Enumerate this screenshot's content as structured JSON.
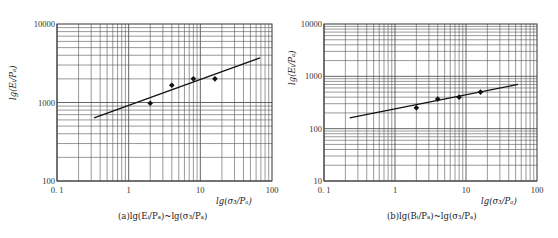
{
  "chart_data": [
    {
      "id": "a",
      "type": "scatter",
      "scale": "log-log",
      "caption": "(a)lg(Eᵢ/Pₐ)~lg(σ₃/Pₐ)",
      "xlabel": "lg(σ₃/Pₐ)",
      "ylabel": "lg(Eᵢ/Pₐ)",
      "xlim": [
        0.1,
        100
      ],
      "ylim": [
        100,
        10000
      ],
      "x_ticks": [
        "0.1",
        "1",
        "10",
        "100"
      ],
      "y_ticks": [
        "100",
        "1000",
        "10000"
      ],
      "grid": true,
      "series": [
        {
          "name": "test points",
          "marker": "diamond",
          "x": [
            2.0,
            4.0,
            8.0,
            16.0
          ],
          "y": [
            980,
            1660,
            2000,
            2000
          ]
        },
        {
          "name": "fitted line",
          "style": "line",
          "x": [
            0.33,
            68
          ],
          "y": [
            635,
            3700
          ]
        }
      ]
    },
    {
      "id": "b",
      "type": "scatter",
      "scale": "log-log",
      "caption": "(b)lg(Bᵢ/Pₐ)~lg(σ₃/Pₐ)",
      "xlabel": "lg(σ₃/Pₐ)",
      "ylabel": "lg(Eᵢ/Pₐ)",
      "xlim": [
        0.1,
        100
      ],
      "ylim": [
        10,
        10000
      ],
      "x_ticks": [
        "0.1",
        "1",
        "10",
        "100"
      ],
      "y_ticks": [
        "10",
        "100",
        "1000",
        "10000"
      ],
      "grid": true,
      "series": [
        {
          "name": "test points",
          "marker": "diamond",
          "x": [
            2.0,
            4.0,
            8.0,
            16.0
          ],
          "y": [
            250,
            370,
            400,
            500
          ]
        },
        {
          "name": "fitted line",
          "style": "line",
          "x": [
            0.23,
            54
          ],
          "y": [
            160,
            700
          ]
        }
      ]
    }
  ],
  "layout": {
    "a": {
      "left": 57,
      "right": 272,
      "top": 24,
      "bottom": 181
    },
    "b": {
      "left": 45,
      "right": 258,
      "top": 24,
      "bottom": 181
    }
  },
  "colors": {
    "grid": "#555555",
    "line": "#111111",
    "marker": "#111111"
  }
}
